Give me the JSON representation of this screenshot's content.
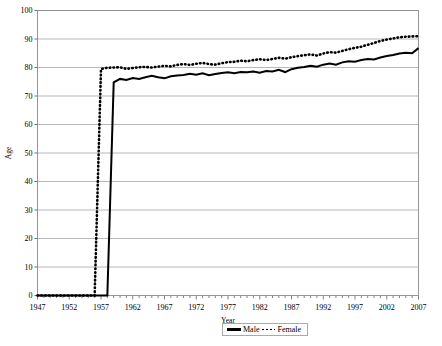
{
  "chart_data": {
    "type": "line",
    "title": "",
    "xlabel": "Year",
    "ylabel": "Age",
    "xlim": [
      1947,
      2007
    ],
    "ylim": [
      0,
      100
    ],
    "grid": true,
    "legend_position": "bottom-right",
    "xticks": [
      "1947",
      "1952",
      "1957",
      "1962",
      "1967",
      "1972",
      "1977",
      "1982",
      "1987",
      "1992",
      "1997",
      "2002",
      "2007"
    ],
    "yticks": [
      "0",
      "10",
      "20",
      "30",
      "40",
      "50",
      "60",
      "70",
      "80",
      "90",
      "100"
    ],
    "x": [
      1947,
      1948,
      1949,
      1950,
      1951,
      1952,
      1953,
      1954,
      1955,
      1956,
      1957,
      1958,
      1959,
      1960,
      1961,
      1962,
      1963,
      1964,
      1965,
      1966,
      1967,
      1968,
      1969,
      1970,
      1971,
      1972,
      1973,
      1974,
      1975,
      1976,
      1977,
      1978,
      1979,
      1980,
      1981,
      1982,
      1983,
      1984,
      1985,
      1986,
      1987,
      1988,
      1989,
      1990,
      1991,
      1992,
      1993,
      1994,
      1995,
      1996,
      1997,
      1998,
      1999,
      2000,
      2001,
      2002,
      2003,
      2004,
      2005,
      2006,
      2007
    ],
    "series": [
      {
        "name": "Male",
        "style": "solid",
        "color": "#000000",
        "values": [
          0,
          0,
          0,
          0,
          0,
          0,
          0,
          0,
          0,
          0,
          0,
          0,
          74.8,
          76.0,
          75.6,
          76.3,
          76.0,
          76.6,
          77.1,
          76.6,
          76.2,
          76.9,
          77.2,
          77.4,
          77.8,
          77.5,
          78.0,
          77.3,
          77.7,
          78.1,
          78.3,
          78.0,
          78.4,
          78.3,
          78.6,
          78.2,
          78.8,
          78.6,
          79.2,
          78.4,
          79.4,
          79.9,
          80.2,
          80.6,
          80.3,
          81.0,
          81.4,
          81.0,
          81.8,
          82.2,
          82.0,
          82.6,
          83.0,
          82.8,
          83.5,
          84.0,
          84.4,
          84.9,
          85.2,
          85.0,
          86.8
        ]
      },
      {
        "name": "Female",
        "style": "dotted",
        "color": "#000000",
        "values": [
          0,
          0,
          0,
          0,
          0,
          0,
          0,
          0,
          0,
          0,
          79.5,
          79.9,
          80.0,
          80.1,
          79.5,
          79.8,
          80.1,
          80.2,
          80.0,
          80.3,
          80.6,
          80.4,
          80.9,
          81.2,
          80.9,
          81.3,
          81.6,
          81.2,
          81.0,
          81.5,
          81.9,
          82.0,
          82.4,
          82.2,
          82.6,
          82.9,
          82.6,
          83.0,
          83.4,
          83.1,
          83.6,
          84.0,
          84.3,
          84.6,
          84.2,
          84.9,
          85.4,
          85.2,
          85.8,
          86.4,
          86.9,
          87.3,
          88.0,
          88.6,
          89.3,
          89.8,
          90.2,
          90.6,
          90.8,
          90.9,
          91.0
        ]
      }
    ]
  },
  "legend": {
    "male_label": "Male",
    "female_label": "Female"
  }
}
